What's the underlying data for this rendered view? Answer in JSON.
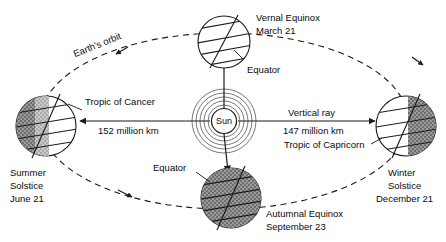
{
  "diagram": {
    "background_color": "#ffffff",
    "line_color": "#1a1a1a",
    "shade_color": "#8d8d8d"
  },
  "orbit": {
    "label": "Earth's orbit",
    "style": "dashed-ellipse",
    "direction_arrows": 2
  },
  "sun": {
    "label": "Sun",
    "ring_count": 5
  },
  "positions": [
    {
      "id": "vernal-equinox",
      "name_line1": "Vernal Equinox",
      "name_line2": "March 21",
      "shading": "none",
      "sub_label": "Equator"
    },
    {
      "id": "summer-solstice",
      "name_line1": "Summer",
      "name_line2": "Solstice",
      "name_line3": "June 21",
      "shading": "left",
      "sub_label": "Tropic of Cancer"
    },
    {
      "id": "autumnal-equinox",
      "name_line1": "Autumnal Equinox",
      "name_line2": "September 23",
      "shading": "full",
      "sub_label": "Equator"
    },
    {
      "id": "winter-solstice",
      "name_line1": "Winter",
      "name_line2": "Solstice",
      "name_line3": "December 21",
      "shading": "right",
      "sub_label": "Tropic of Capricorn"
    }
  ],
  "distances": {
    "left_label": "152 million km",
    "right_label": "147 million km",
    "right_ray_label": "Vertical ray"
  }
}
